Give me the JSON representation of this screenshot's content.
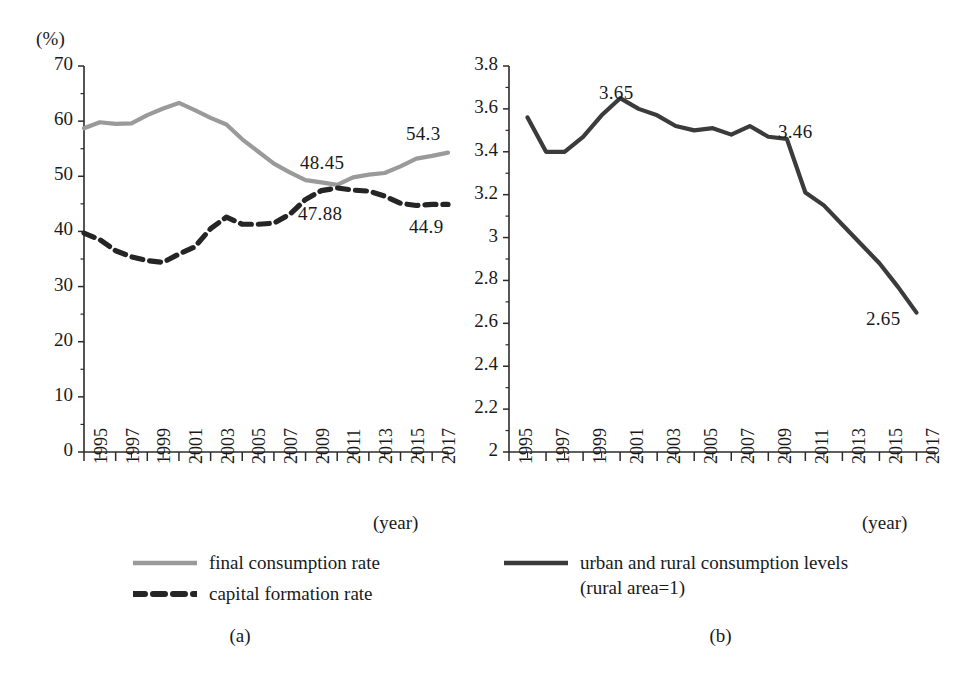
{
  "figure": {
    "panels": [
      {
        "id": "a",
        "caption": "(a)",
        "y_unit_label": "(%)",
        "x_caption": "(year)",
        "legend": [
          {
            "label": "final consumption rate",
            "style": "solid",
            "color": "#9a9a9a"
          },
          {
            "label": "capital formation rate",
            "style": "dashed",
            "color": "#252525"
          }
        ],
        "annotations": [
          {
            "text": "48.45",
            "x": 300,
            "y": 152
          },
          {
            "text": "54.3",
            "x": 406,
            "y": 123
          },
          {
            "text": "47.88",
            "x": 298,
            "y": 203
          },
          {
            "text": "44.9",
            "x": 409,
            "y": 216
          }
        ]
      },
      {
        "id": "b",
        "caption": "(b)",
        "y_unit_label": "",
        "x_caption": "(year)",
        "legend": [
          {
            "label": "urban and rural consumption levels\n(rural area=1)",
            "style": "solid",
            "color": "#3b3b3b"
          }
        ],
        "annotations": [
          {
            "text": "3.65",
            "x": 119,
            "y": 82
          },
          {
            "text": "3.46",
            "x": 298,
            "y": 121
          },
          {
            "text": "2.65",
            "x": 386,
            "y": 308
          }
        ]
      }
    ]
  },
  "chart_data": [
    {
      "type": "line",
      "panel": "(a)",
      "title": "",
      "xlabel": "(year)",
      "ylabel": "(%)",
      "xlim": [
        1995,
        2018
      ],
      "ylim": [
        0,
        70
      ],
      "yticks": [
        0,
        10,
        20,
        30,
        40,
        50,
        60,
        70
      ],
      "xticks": [
        1995,
        1997,
        1999,
        2001,
        2003,
        2005,
        2007,
        2009,
        2011,
        2013,
        2015,
        2017
      ],
      "xtick_labels": [
        "1995",
        "1997",
        "1999",
        "2001",
        "2003",
        "2005",
        "2007",
        "2009",
        "2011",
        "2013",
        "2015",
        "2017"
      ],
      "ytick_labels": [
        "0",
        "10",
        "20",
        "30",
        "40",
        "50",
        "60",
        "70"
      ],
      "grid": false,
      "legend_position": "below",
      "x": [
        1995,
        1996,
        1997,
        1998,
        1999,
        2000,
        2001,
        2002,
        2003,
        2004,
        2005,
        2006,
        2007,
        2008,
        2009,
        2010,
        2011,
        2012,
        2013,
        2014,
        2015,
        2016,
        2017,
        2018
      ],
      "series": [
        {
          "name": "final consumption rate",
          "color": "#9a9a9a",
          "style": "solid",
          "values": [
            58.7,
            59.8,
            59.5,
            59.6,
            61.1,
            62.3,
            63.3,
            62.0,
            60.6,
            59.4,
            56.7,
            54.5,
            52.3,
            50.7,
            49.3,
            48.9,
            48.45,
            49.8,
            50.3,
            50.6,
            51.8,
            53.2,
            53.7,
            54.3
          ]
        },
        {
          "name": "capital formation rate",
          "color": "#252525",
          "style": "dashed",
          "values": [
            39.7,
            38.5,
            36.5,
            35.4,
            34.7,
            34.4,
            35.9,
            37.2,
            40.5,
            42.6,
            41.3,
            41.3,
            41.5,
            43.1,
            45.8,
            47.4,
            47.88,
            47.5,
            47.3,
            46.4,
            45.1,
            44.7,
            44.9,
            44.9
          ]
        }
      ],
      "annotations": [
        {
          "text": "48.45",
          "series": "final consumption rate",
          "x": 2011,
          "value": 48.45
        },
        {
          "text": "54.3",
          "series": "final consumption rate",
          "x": 2018,
          "value": 54.3
        },
        {
          "text": "47.88",
          "series": "capital formation rate",
          "x": 2011,
          "value": 47.88
        },
        {
          "text": "44.9",
          "series": "capital formation rate",
          "x": 2018,
          "value": 44.9
        }
      ]
    },
    {
      "type": "line",
      "panel": "(b)",
      "title": "",
      "xlabel": "(year)",
      "ylabel": "",
      "xlim": [
        1995,
        2018
      ],
      "ylim": [
        2,
        3.8
      ],
      "yticks": [
        2,
        2.2,
        2.4,
        2.6,
        2.8,
        3,
        3.2,
        3.4,
        3.6,
        3.8
      ],
      "xticks": [
        1995,
        1997,
        1999,
        2001,
        2003,
        2005,
        2007,
        2009,
        2011,
        2013,
        2015,
        2017
      ],
      "xtick_labels": [
        "1995",
        "1997",
        "1999",
        "2001",
        "2003",
        "2005",
        "2007",
        "2009",
        "2011",
        "2013",
        "2015",
        "2017"
      ],
      "ytick_labels": [
        "2",
        "2.2",
        "2.4",
        "2.6",
        "2.8",
        "3",
        "3.2",
        "3.4",
        "3.6",
        "3.8"
      ],
      "grid": false,
      "legend_position": "below",
      "x": [
        1996,
        1997,
        1998,
        1999,
        2000,
        2001,
        2002,
        2003,
        2004,
        2005,
        2006,
        2007,
        2008,
        2009,
        2010,
        2011,
        2012,
        2013,
        2014,
        2015,
        2016,
        2017
      ],
      "series": [
        {
          "name": "urban and rural consumption levels (rural area=1)",
          "color": "#3b3b3b",
          "style": "solid",
          "values": [
            3.56,
            3.4,
            3.4,
            3.47,
            3.57,
            3.65,
            3.6,
            3.57,
            3.52,
            3.5,
            3.51,
            3.48,
            3.52,
            3.47,
            3.46,
            3.21,
            3.15,
            3.06,
            2.97,
            2.88,
            2.77,
            2.65
          ]
        }
      ],
      "annotations": [
        {
          "text": "3.65",
          "x": 2001,
          "value": 3.65
        },
        {
          "text": "3.46",
          "x": 2010,
          "value": 3.46
        },
        {
          "text": "2.65",
          "x": 2017,
          "value": 2.65
        }
      ]
    }
  ]
}
